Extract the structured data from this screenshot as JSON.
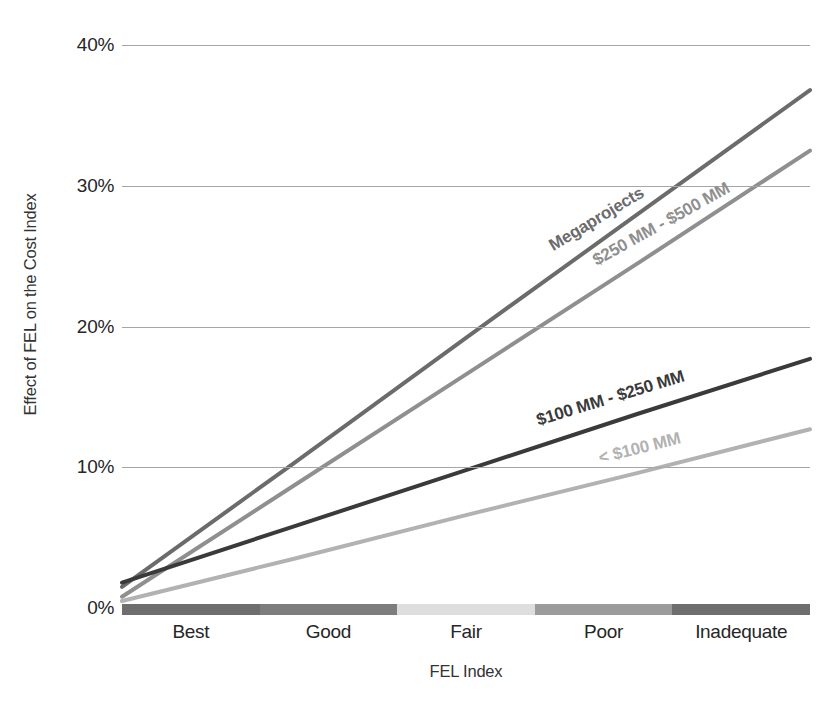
{
  "chart_data": {
    "type": "line",
    "title": "",
    "xlabel": "FEL Index",
    "ylabel": "Effect of FEL on the Cost Index",
    "categories": [
      "Best",
      "Good",
      "Fair",
      "Poor",
      "Inadequate"
    ],
    "x": [
      0,
      1,
      2,
      3,
      4
    ],
    "ylim": [
      0,
      40
    ],
    "yticks": [
      0,
      10,
      20,
      30,
      40
    ],
    "ytick_labels": [
      "0%",
      "10%",
      "20%",
      "30%",
      "40%"
    ],
    "grid": "horizontal",
    "legend": "inline-labels-along-lines",
    "series": [
      {
        "name": "Megaprojects",
        "color": "#6b6b6b",
        "values": [
          1.5,
          10.3,
          19.2,
          28.0,
          36.8
        ],
        "label_angle_deg": -31
      },
      {
        "name": "$250 MM - $500 MM",
        "color": "#8f8f8f",
        "values": [
          0.8,
          8.7,
          16.6,
          24.5,
          32.5
        ],
        "label_angle_deg": -29
      },
      {
        "name": "$100 MM - $250 MM",
        "color": "#3a3a3a",
        "values": [
          1.8,
          5.8,
          9.8,
          13.8,
          17.7
        ],
        "label_angle_deg": -17
      },
      {
        "name": "< $100 MM",
        "color": "#b2b2b2",
        "values": [
          0.5,
          3.5,
          6.6,
          9.6,
          12.7
        ],
        "label_angle_deg": -14
      }
    ],
    "x_axis_band": {
      "segments": [
        {
          "label": "Best",
          "color": "#6e6e6e"
        },
        {
          "label": "Good",
          "color": "#7d7d7d"
        },
        {
          "label": "Fair",
          "color": "#dedede"
        },
        {
          "label": "Poor",
          "color": "#9b9b9b"
        },
        {
          "label": "Inadequate",
          "color": "#6e6e6e"
        }
      ]
    },
    "gridline_color": "#a6a6a6"
  }
}
